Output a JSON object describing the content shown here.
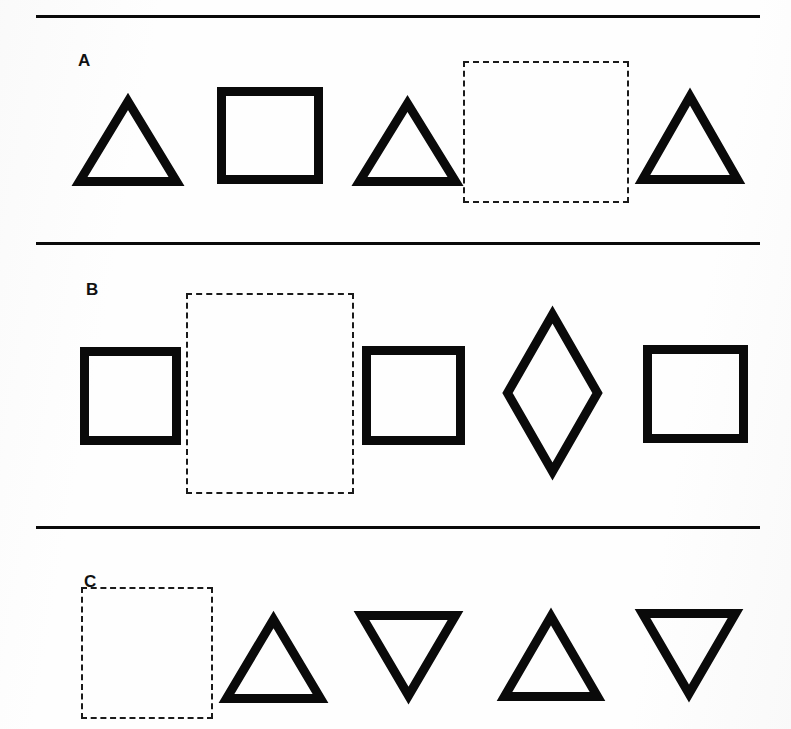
{
  "page": {
    "background_color": "#fdfdfd",
    "ink_color": "#0a0a0a",
    "width": 791,
    "height": 729
  },
  "separators": [
    {
      "name": "rule-top",
      "x": 36,
      "y": 15,
      "width": 724
    },
    {
      "name": "rule-middle",
      "x": 36,
      "y": 242,
      "width": 724
    },
    {
      "name": "rule-bottom",
      "x": 36,
      "y": 526,
      "width": 724
    }
  ],
  "rows": [
    {
      "label": "A",
      "label_x": 78,
      "label_y": 52,
      "items": [
        {
          "kind": "triangle-up",
          "x": 74,
          "y": 96,
          "width": 108,
          "height": 90,
          "filled": false,
          "blank": false
        },
        {
          "kind": "square",
          "x": 217,
          "y": 87,
          "width": 106,
          "height": 97,
          "filled": false,
          "blank": false
        },
        {
          "kind": "triangle-up",
          "x": 354,
          "y": 98,
          "width": 107,
          "height": 88,
          "filled": false,
          "blank": false
        },
        {
          "kind": "blank-box",
          "x": 463,
          "y": 61,
          "width": 166,
          "height": 142,
          "filled": false,
          "blank": true
        },
        {
          "kind": "triangle-up",
          "x": 637,
          "y": 91,
          "width": 106,
          "height": 93,
          "filled": false,
          "blank": false
        }
      ]
    },
    {
      "label": "B",
      "label_x": 86,
      "label_y": 281,
      "items": [
        {
          "kind": "square",
          "x": 80,
          "y": 347,
          "width": 101,
          "height": 98,
          "filled": false,
          "blank": false
        },
        {
          "kind": "blank-box",
          "x": 186,
          "y": 293,
          "width": 168,
          "height": 201,
          "filled": false,
          "blank": true
        },
        {
          "kind": "square",
          "x": 362,
          "y": 346,
          "width": 103,
          "height": 99,
          "filled": false,
          "blank": false
        },
        {
          "kind": "diamond",
          "x": 503,
          "y": 310,
          "width": 99,
          "height": 166,
          "filled": false,
          "blank": false
        },
        {
          "kind": "square",
          "x": 643,
          "y": 345,
          "width": 105,
          "height": 98,
          "filled": false,
          "blank": false
        }
      ]
    },
    {
      "label": "C",
      "label_x": 84,
      "label_y": 573,
      "items": [
        {
          "kind": "blank-box",
          "x": 81,
          "y": 587,
          "width": 132,
          "height": 132,
          "filled": false,
          "blank": true
        },
        {
          "kind": "triangle-up",
          "x": 221,
          "y": 614,
          "width": 105,
          "height": 89,
          "filled": false,
          "blank": false
        },
        {
          "kind": "triangle-down",
          "x": 356,
          "y": 611,
          "width": 105,
          "height": 90,
          "filled": false,
          "blank": false
        },
        {
          "kind": "triangle-up",
          "x": 499,
          "y": 611,
          "width": 104,
          "height": 90,
          "filled": false,
          "blank": false
        },
        {
          "kind": "triangle-down",
          "x": 637,
          "y": 609,
          "width": 104,
          "height": 90,
          "filled": false,
          "blank": false
        }
      ]
    }
  ],
  "style": {
    "shape_stroke_width": 9,
    "blank_dash": "2px dashed",
    "rule_thickness": 3
  }
}
